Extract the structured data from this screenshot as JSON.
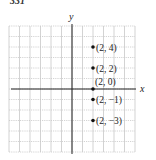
{
  "figure": {
    "label": "331"
  },
  "chart_data": {
    "type": "scatter",
    "title": "",
    "xlabel": "x",
    "ylabel": "y",
    "xlim": [
      -6,
      6
    ],
    "ylim": [
      -6,
      6
    ],
    "grid": true,
    "points": [
      {
        "x": 2,
        "y": 4,
        "label": "(2, 4)"
      },
      {
        "x": 2,
        "y": 2,
        "label": "(2, 2)"
      },
      {
        "x": 2,
        "y": 0,
        "label": "(2, 0)"
      },
      {
        "x": 2,
        "y": -1,
        "label": "(2, −1)"
      },
      {
        "x": 2,
        "y": -3,
        "label": "(2, −3)"
      }
    ]
  }
}
